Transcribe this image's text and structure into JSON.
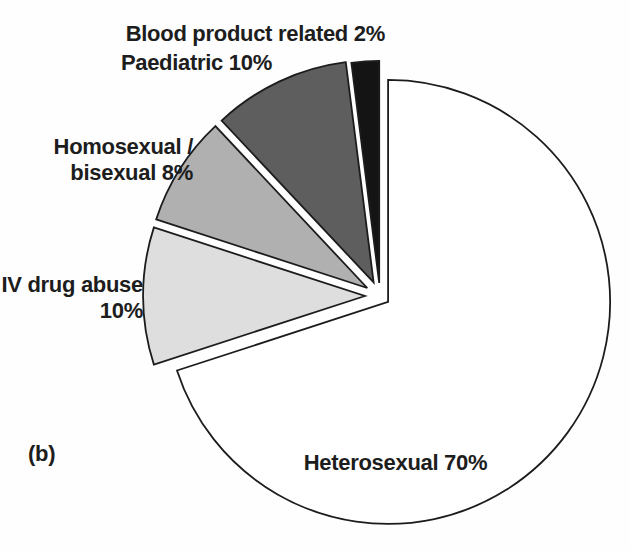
{
  "labels": {
    "blood": "Blood product related 2%",
    "paediatric": "Paediatric 10%",
    "homosexual_line1": "Homosexual /",
    "homosexual_line2": "bisexual 8%",
    "iv_line1": "IV drug abuse",
    "iv_line2": "10%",
    "heterosexual": "Heterosexual 70%"
  },
  "chart_data": {
    "type": "pie",
    "title": "",
    "figure_label": "(b)",
    "start_angle_deg": 0,
    "direction": "clockwise",
    "total_percent": 100,
    "legend_position": "none",
    "center": [
      380,
      296
    ],
    "radius": 222,
    "stroke": "#1c1c1c",
    "stroke_width": 1.8,
    "background": "#fefefe",
    "slices": [
      {
        "label": "Heterosexual",
        "percent": 70,
        "color": "#ffffff",
        "explode_px": 10
      },
      {
        "label": "IV drug abuse",
        "percent": 10,
        "color": "#dedede",
        "explode_px": 15
      },
      {
        "label": "Homosexual / bisexual",
        "percent": 8,
        "color": "#b0b0b0",
        "explode_px": 15
      },
      {
        "label": "Paediatric",
        "percent": 10,
        "color": "#5e5e5e",
        "explode_px": 15
      },
      {
        "label": "Blood product related",
        "percent": 2,
        "color": "#141414",
        "explode_px": 13
      }
    ]
  }
}
